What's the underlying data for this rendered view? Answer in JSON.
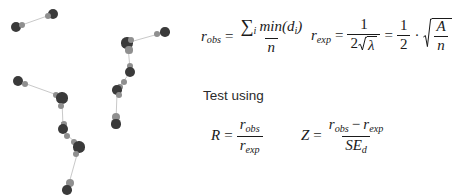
{
  "slide": {
    "title_text": "Test using",
    "background_color": "#ffffff",
    "ink_color": "#1a1a1a"
  },
  "formulas": {
    "r_obs": {
      "lhs": "r",
      "lhs_sub": "obs",
      "equals": "=",
      "numerator_sum": "∑",
      "numerator_sum_sub": "i",
      "numerator_fn": "min",
      "numerator_open": "(",
      "numerator_var": "d",
      "numerator_var_sub": "i",
      "numerator_close": ")",
      "denominator": "n"
    },
    "r_exp": {
      "lhs": "r",
      "lhs_sub": "exp",
      "equals": "=",
      "first_numerator": "1",
      "first_denominator_coef": "2",
      "first_denominator_radicand": "λ",
      "equals2": "=",
      "second_numerator": "1",
      "second_denominator": "2",
      "multiply": "·",
      "sqrt_numerator": "A",
      "sqrt_denominator": "n"
    },
    "R": {
      "lhs": "R",
      "equals": "=",
      "numerator": "r",
      "numerator_sub": "obs",
      "denominator": "r",
      "denominator_sub": "exp"
    },
    "Z": {
      "lhs": "Z",
      "equals": "=",
      "numerator_a": "r",
      "numerator_a_sub": "obs",
      "minus": "−",
      "numerator_b": "r",
      "numerator_b_sub": "exp",
      "denominator": "SE",
      "denominator_sub": "d"
    }
  },
  "chart_data": {
    "type": "scatter",
    "title": "",
    "xlabel": "",
    "ylabel": "",
    "grid": false,
    "legend": null,
    "xlim": [
      0,
      195
    ],
    "ylim": [
      0,
      196
    ],
    "colors": {
      "dark_point": "#3a3a3a",
      "mid_point": "#8f8f8f",
      "light_point": "#b5b5b5",
      "link_line": "#c9c9c9"
    },
    "points": [
      {
        "x": 16,
        "y": 27,
        "size": 5.0,
        "shade": "dark"
      },
      {
        "x": 22,
        "y": 25,
        "size": 3.0,
        "shade": "mid"
      },
      {
        "x": 53,
        "y": 14,
        "size": 5.0,
        "shade": "dark"
      },
      {
        "x": 48,
        "y": 16,
        "size": 3.0,
        "shade": "mid"
      },
      {
        "x": 127,
        "y": 43,
        "size": 5.6,
        "shade": "dark"
      },
      {
        "x": 131,
        "y": 40,
        "size": 3.0,
        "shade": "mid"
      },
      {
        "x": 157,
        "y": 34,
        "size": 3.2,
        "shade": "mid"
      },
      {
        "x": 165,
        "y": 32,
        "size": 4.8,
        "shade": "dark"
      },
      {
        "x": 129,
        "y": 50,
        "size": 3.6,
        "shade": "mid"
      },
      {
        "x": 130,
        "y": 66,
        "size": 3.0,
        "shade": "mid"
      },
      {
        "x": 130,
        "y": 72,
        "size": 5.2,
        "shade": "dark"
      },
      {
        "x": 124,
        "y": 82,
        "size": 3.2,
        "shade": "mid"
      },
      {
        "x": 120,
        "y": 87,
        "size": 3.0,
        "shade": "mid"
      },
      {
        "x": 117,
        "y": 90,
        "size": 4.8,
        "shade": "dark"
      },
      {
        "x": 119,
        "y": 95,
        "size": 3.0,
        "shade": "mid"
      },
      {
        "x": 116,
        "y": 117,
        "size": 4.2,
        "shade": "mid"
      },
      {
        "x": 116,
        "y": 124,
        "size": 4.6,
        "shade": "dark"
      },
      {
        "x": 18,
        "y": 81,
        "size": 5.0,
        "shade": "dark"
      },
      {
        "x": 25,
        "y": 84,
        "size": 3.4,
        "shade": "mid"
      },
      {
        "x": 56,
        "y": 95,
        "size": 3.2,
        "shade": "mid"
      },
      {
        "x": 62,
        "y": 98,
        "size": 5.6,
        "shade": "dark"
      },
      {
        "x": 61,
        "y": 106,
        "size": 3.2,
        "shade": "mid"
      },
      {
        "x": 64,
        "y": 124,
        "size": 3.0,
        "shade": "mid"
      },
      {
        "x": 63,
        "y": 129,
        "size": 5.2,
        "shade": "dark"
      },
      {
        "x": 67,
        "y": 136,
        "size": 3.0,
        "shade": "mid"
      },
      {
        "x": 74,
        "y": 142,
        "size": 3.2,
        "shade": "mid"
      },
      {
        "x": 79,
        "y": 147,
        "size": 5.6,
        "shade": "dark"
      },
      {
        "x": 76,
        "y": 154,
        "size": 3.0,
        "shade": "mid"
      },
      {
        "x": 70,
        "y": 183,
        "size": 4.2,
        "shade": "mid"
      },
      {
        "x": 67,
        "y": 190,
        "size": 4.8,
        "shade": "dark"
      }
    ],
    "links": [
      {
        "x1": 19,
        "y1": 26,
        "x2": 50,
        "y2": 15
      },
      {
        "x1": 130,
        "y1": 42,
        "x2": 162,
        "y2": 33
      },
      {
        "x1": 128,
        "y1": 46,
        "x2": 130,
        "y2": 69
      },
      {
        "x1": 129,
        "y1": 74,
        "x2": 118,
        "y2": 88
      },
      {
        "x1": 117,
        "y1": 93,
        "x2": 116,
        "y2": 121
      },
      {
        "x1": 21,
        "y1": 82,
        "x2": 60,
        "y2": 96
      },
      {
        "x1": 62,
        "y1": 101,
        "x2": 63,
        "y2": 126
      },
      {
        "x1": 64,
        "y1": 132,
        "x2": 78,
        "y2": 145
      },
      {
        "x1": 78,
        "y1": 151,
        "x2": 68,
        "y2": 187
      }
    ]
  }
}
